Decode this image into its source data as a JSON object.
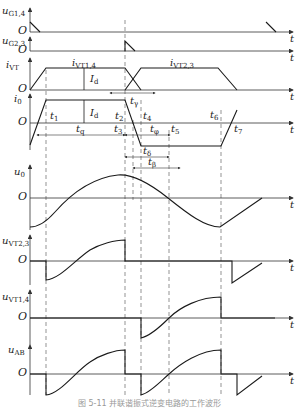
{
  "figure": {
    "caption": "图 5-11  并联谐振式逆变电路的工作波形"
  },
  "axes": {
    "uG14": {
      "label": "u",
      "sub": "G1,4",
      "origin": "O",
      "xlabel": "t"
    },
    "uG23": {
      "label": "u",
      "sub": "G2,3",
      "origin": "O",
      "xlabel": "t"
    },
    "iVT": {
      "label": "i",
      "sub": "VT",
      "origin": "O",
      "xlabel": "t"
    },
    "i0": {
      "label": "i",
      "sub": "0",
      "origin": "O",
      "xlabel": "t"
    },
    "u0": {
      "label": "u",
      "sub": "0",
      "origin": "O",
      "xlabel": "t"
    },
    "uVT23": {
      "label": "u",
      "sub": "VT2,3",
      "origin": "O",
      "xlabel": "t"
    },
    "uVT14": {
      "label": "u",
      "sub": "VT1,4",
      "origin": "O",
      "xlabel": "t"
    },
    "uAB": {
      "label": "u",
      "sub": "AB",
      "origin": "O",
      "xlabel": "t"
    }
  },
  "annotations": {
    "iVT14": {
      "label": "i",
      "sub": "VT1,4"
    },
    "iVT23": {
      "label": "i",
      "sub": "VT2,3"
    },
    "Id_top": {
      "label": "I",
      "sub": "d"
    },
    "Id_i0": {
      "label": "I",
      "sub": "d"
    },
    "t1": {
      "label": "t",
      "sub": "1"
    },
    "t2": {
      "label": "t",
      "sub": "2"
    },
    "t3": {
      "label": "t",
      "sub": "3"
    },
    "t4": {
      "label": "t",
      "sub": "4"
    },
    "t5": {
      "label": "t",
      "sub": "5"
    },
    "t6": {
      "label": "t",
      "sub": "6"
    },
    "t7": {
      "label": "t",
      "sub": "7"
    },
    "tgamma": {
      "label": "t",
      "sub": "γ"
    },
    "tq": {
      "label": "t",
      "sub": "q"
    },
    "tphi": {
      "label": "t",
      "sub": "φ"
    },
    "tdelta": {
      "label": "t",
      "sub": "δ"
    },
    "tbeta": {
      "label": "t",
      "sub": "β"
    }
  },
  "colors": {
    "line": "#1a1a1a",
    "dash": "#555555",
    "axis": "#333333"
  }
}
